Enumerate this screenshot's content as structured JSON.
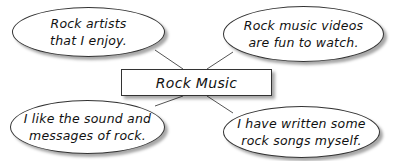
{
  "diagram": {
    "type": "concept-web",
    "center": {
      "label": "Rock Music"
    },
    "nodes": [
      {
        "position": "top-left",
        "lines": [
          "Rock artists",
          "that I enjoy."
        ]
      },
      {
        "position": "top-right",
        "lines": [
          "Rock music videos",
          "are fun to watch."
        ]
      },
      {
        "position": "bottom-left",
        "lines": [
          "I like the sound and",
          "messages of rock."
        ]
      },
      {
        "position": "bottom-right",
        "lines": [
          "I have written some",
          "rock songs myself."
        ]
      }
    ],
    "colors": {
      "stroke": "#333333",
      "fill": "#ffffff",
      "background": "#ffffff"
    }
  }
}
